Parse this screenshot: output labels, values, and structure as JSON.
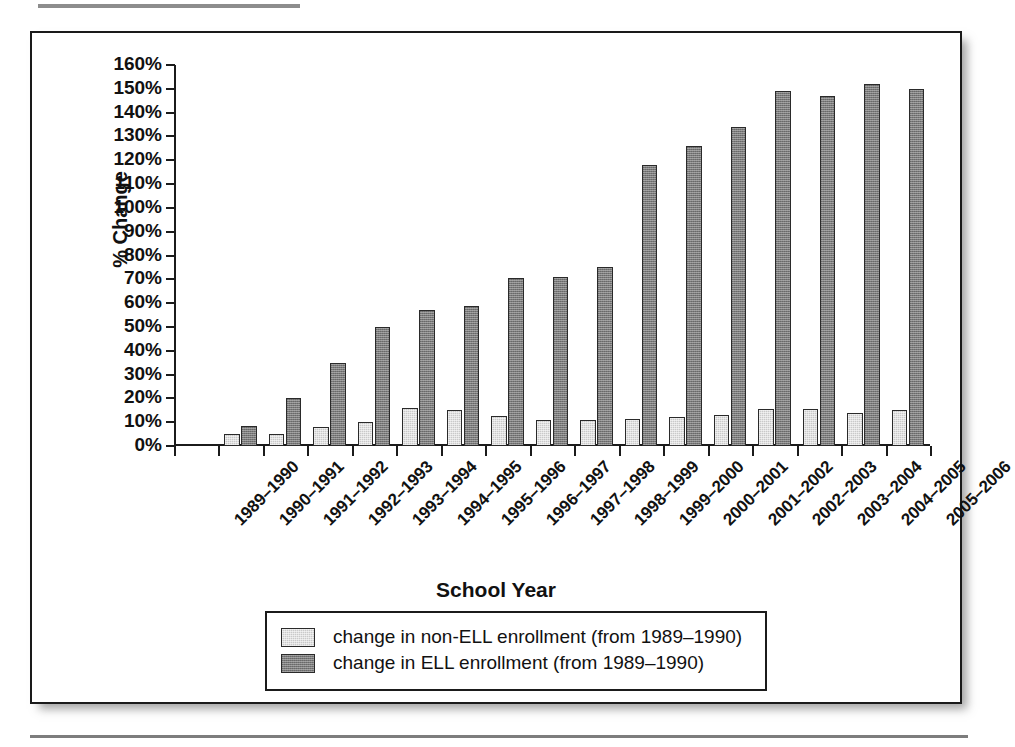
{
  "chart_data": {
    "type": "bar",
    "title": "",
    "xlabel": "School Year",
    "ylabel": "% Change",
    "ylim": [
      0,
      160
    ],
    "ytick_step": 10,
    "grid": false,
    "legend_position": "bottom",
    "ytick_labels": [
      "160%",
      "150%",
      "140%",
      "130%",
      "120%",
      "110%",
      "100%",
      "90%",
      "80%",
      "70%",
      "60%",
      "50%",
      "40%",
      "30%",
      "20%",
      "10%",
      "0%"
    ],
    "categories": [
      "1989–1990",
      "1990–1991",
      "1991–1992",
      "1992–1993",
      "1993–1994",
      "1994–1995",
      "1995–1996",
      "1996–1997",
      "1997–1998",
      "1998–1999",
      "1999–2000",
      "2000–2001",
      "2001–2002",
      "2002–2003",
      "2003–2004",
      "2004–2005",
      "2005–2006"
    ],
    "series": [
      {
        "name": "change in non-ELL enrollment (from 1989–1990)",
        "color": "#c9c9c9",
        "values": [
          0,
          5,
          5,
          8,
          10,
          16,
          15,
          12.5,
          11,
          11,
          11.5,
          12,
          13,
          15.5,
          15.5,
          14,
          15
        ]
      },
      {
        "name": "change in ELL enrollment (from 1989–1990)",
        "color": "#7a7a7a",
        "values": [
          0,
          8.5,
          20,
          35,
          50,
          57,
          59,
          70.5,
          71,
          75,
          118,
          126,
          134,
          149,
          147,
          152,
          150
        ]
      }
    ]
  },
  "legend": {
    "items": [
      {
        "label": "change in non-ELL enrollment (from 1989–1990)",
        "swatch": "light"
      },
      {
        "label": "change in ELL enrollment (from 1989–1990)",
        "swatch": "dark"
      }
    ]
  }
}
